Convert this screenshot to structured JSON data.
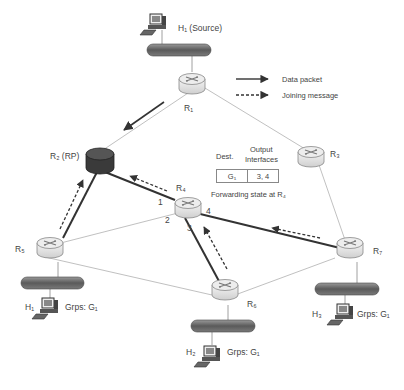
{
  "nodes": {
    "source_host": {
      "label": "H₁ (Source)"
    },
    "r1": {
      "label": "R₁"
    },
    "r2": {
      "label": "R₂ (RP)"
    },
    "r3": {
      "label": "R₃"
    },
    "r4": {
      "label": "R₄"
    },
    "r5": {
      "label": "R₅"
    },
    "r6": {
      "label": "R₆"
    },
    "r7": {
      "label": "R₇"
    },
    "h1": {
      "label": "H₁",
      "groups": "Grps: G₁"
    },
    "h2": {
      "label": "H₂",
      "groups": "Grps: G₁"
    },
    "h3": {
      "label": "H₃",
      "groups": "Grps: G₁"
    }
  },
  "interfaces": {
    "i1": "1",
    "i2": "2",
    "i3": "3",
    "i4": "4"
  },
  "legend": {
    "data_packet": "Data packet",
    "joining_message": "Joining message"
  },
  "forwarding_table": {
    "header_dest": "Dest.",
    "header_output": "Output",
    "header_output2": "Interfaces",
    "row_dest": "G₁",
    "row_output": "3, 4",
    "caption": "Forwarding state at R₄"
  },
  "colors": {
    "thick_link": "#333333",
    "thin_link": "#aaaaaa",
    "rp_router": "#3a3a3a",
    "router": "#e4e4e4",
    "bus": "#6a6a6a"
  }
}
